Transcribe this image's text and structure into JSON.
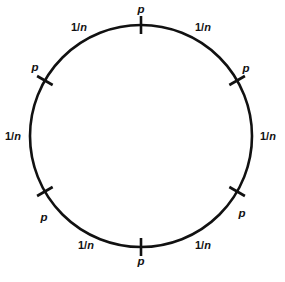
{
  "figure": {
    "type": "diagram",
    "kind": "circle-with-tick-marks",
    "background_color": "#ffffff",
    "stroke_color": "#111111",
    "text_color": "#111111",
    "circle": {
      "center_x": 141,
      "center_y": 136,
      "radius": 111,
      "stroke_width": 2.6
    },
    "tick_marks": [
      {
        "id": "tick-top",
        "angle_deg": 90,
        "label": "p"
      },
      {
        "id": "tick-upper-left",
        "angle_deg": 150,
        "label": "p"
      },
      {
        "id": "tick-lower-left",
        "angle_deg": 210,
        "label": "p"
      },
      {
        "id": "tick-bottom",
        "angle_deg": 270,
        "label": "p"
      },
      {
        "id": "tick-lower-right",
        "angle_deg": 330,
        "label": "p"
      },
      {
        "id": "tick-upper-right",
        "angle_deg": 30,
        "label": "p"
      }
    ],
    "arc_labels": [
      {
        "id": "arc-top-left",
        "numerator": "1",
        "separator": "/",
        "denominator": "n",
        "x": 79,
        "y": 27
      },
      {
        "id": "arc-top-right",
        "numerator": "1",
        "separator": "/",
        "denominator": "n",
        "x": 203,
        "y": 27
      },
      {
        "id": "arc-left",
        "numerator": "1",
        "separator": "/",
        "denominator": "n",
        "x": 13,
        "y": 136
      },
      {
        "id": "arc-right",
        "numerator": "1",
        "separator": "/",
        "denominator": "n",
        "x": 268,
        "y": 136
      },
      {
        "id": "arc-bottom-left",
        "numerator": "1",
        "separator": "/",
        "denominator": "n",
        "x": 86,
        "y": 245
      },
      {
        "id": "arc-bottom-right",
        "numerator": "1",
        "separator": "/",
        "denominator": "n",
        "x": 203,
        "y": 245
      }
    ],
    "point_labels": [
      {
        "id": "p-top",
        "text": "p",
        "x": 141,
        "y": 10
      },
      {
        "id": "p-upper-left",
        "text": "p",
        "x": 35,
        "y": 68
      },
      {
        "id": "p-upper-right",
        "text": "p",
        "x": 246,
        "y": 69
      },
      {
        "id": "p-lower-left",
        "text": "p",
        "x": 44,
        "y": 218
      },
      {
        "id": "p-lower-right",
        "text": "p",
        "x": 242,
        "y": 214
      },
      {
        "id": "p-bottom",
        "text": "p",
        "x": 141,
        "y": 262
      }
    ]
  }
}
